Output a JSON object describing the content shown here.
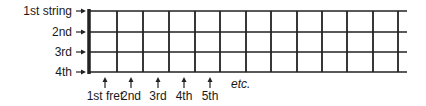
{
  "diagram": {
    "strings": [
      {
        "label": "1st string",
        "y": 11
      },
      {
        "label": "2nd",
        "y": 32
      },
      {
        "label": "3rd",
        "y": 52
      },
      {
        "label": "4th",
        "y": 72
      }
    ],
    "frets": [
      {
        "label": "1st fret",
        "arrow_x": 105
      },
      {
        "label": "2nd",
        "arrow_x": 131
      },
      {
        "label": "3rd",
        "arrow_x": 158
      },
      {
        "label": "4th",
        "arrow_x": 184
      },
      {
        "label": "5th",
        "arrow_x": 210
      }
    ],
    "continuation_label": "etc.",
    "nut_x": 89,
    "fret_lines_x": [
      117,
      143,
      169,
      195,
      220,
      246,
      271,
      297,
      322,
      347,
      373,
      398
    ],
    "strings_end_x": 407,
    "line_color": "#222222"
  }
}
